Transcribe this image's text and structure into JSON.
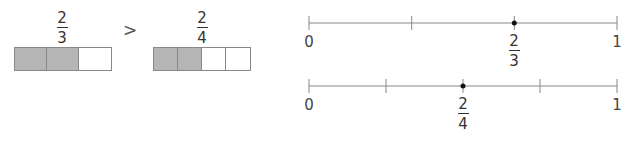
{
  "left_comparison": {
    "fraction_a": {
      "numerator": "2",
      "denominator": "3",
      "shaded": 2,
      "parts": 3
    },
    "comparator": ">",
    "fraction_b": {
      "numerator": "2",
      "denominator": "4",
      "shaded": 2,
      "parts": 4
    }
  },
  "number_lines": [
    {
      "start_label": "0",
      "end_label": "1",
      "divisions": 3,
      "point": {
        "numerator": "2",
        "denominator": "3",
        "position": 0.6667
      }
    },
    {
      "start_label": "0",
      "end_label": "1",
      "divisions": 4,
      "point": {
        "numerator": "2",
        "denominator": "4",
        "position": 0.5
      }
    }
  ],
  "colors": {
    "shaded": "#b5b5b5",
    "line": "#888888",
    "dot": "#111111"
  }
}
